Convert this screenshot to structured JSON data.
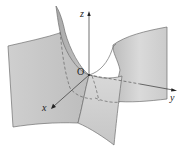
{
  "figure": {
    "colors": {
      "surface_light": "#d6d6d6",
      "surface_mid": "#c4c4c4",
      "surface_dark": "#b2b2b2",
      "edge": "#6e6e6e",
      "axis": "#333333",
      "background": "#ffffff"
    },
    "axes": {
      "x": {
        "label": "x"
      },
      "y": {
        "label": "y"
      },
      "z": {
        "label": "z"
      },
      "origin": {
        "label": "O"
      }
    }
  }
}
